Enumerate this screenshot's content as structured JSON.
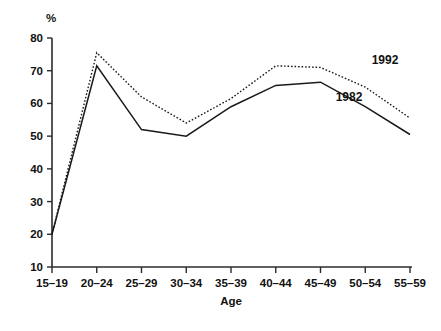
{
  "chart_data": {
    "type": "line",
    "title": "",
    "subtitle": "",
    "xlabel": "Age",
    "ylabel": "%",
    "categories": [
      "15–19",
      "20–24",
      "25–29",
      "30–34",
      "35–39",
      "40–44",
      "45–49",
      "50–54",
      "55–59"
    ],
    "ylim": [
      10,
      80
    ],
    "ytick_labels": [
      "10",
      "20",
      "30",
      "40",
      "50",
      "60",
      "70",
      "80"
    ],
    "yticks": [
      10,
      20,
      30,
      40,
      50,
      60,
      70,
      80
    ],
    "grid": false,
    "legend_position": "inline-annotations",
    "series": [
      {
        "name": "1982",
        "style": "solid",
        "color": "#1a1a1a",
        "values": [
          20,
          71.5,
          52,
          50,
          59,
          65.5,
          66.5,
          59,
          50.5
        ]
      },
      {
        "name": "1992",
        "style": "dotted",
        "color": "#1a1a1a",
        "values": [
          20,
          75.5,
          62,
          54,
          61.5,
          71.5,
          71,
          65,
          55.5
        ]
      }
    ],
    "annotations": [
      {
        "text": "1992",
        "series": "1992",
        "x_px": 385,
        "y_px": 64
      },
      {
        "text": "1982",
        "series": "1982",
        "x_px": 349,
        "y_px": 101
      }
    ]
  }
}
